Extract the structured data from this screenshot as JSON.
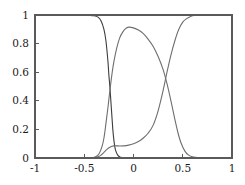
{
  "chart_data": {
    "type": "line",
    "title": "",
    "subtitle": "",
    "xlabel": "",
    "ylabel": "",
    "xlim": [
      -1,
      1
    ],
    "ylim": [
      0,
      1
    ],
    "grid": false,
    "legend": "none",
    "background_color": "#ffffff",
    "axis_color": "#5a5a5a",
    "xticks": [
      -1,
      -0.5,
      0,
      0.5,
      1
    ],
    "xtick_labels": [
      "-1",
      "-0.5",
      "0",
      "0.5",
      "1"
    ],
    "yticks": [
      0,
      0.2,
      0.4,
      0.6,
      0.8,
      1
    ],
    "ytick_labels": [
      "0",
      "0.2",
      "0.4",
      "0.6",
      "0.8",
      "1"
    ],
    "series": [
      {
        "name": "class-1-posterior",
        "color": "#3d3d3d",
        "linewidth": 1.1,
        "description": "High plateau at 1 on the left, sharp sigmoid drop to 0 near x = -0.23",
        "x": [
          -1.0,
          -0.9,
          -0.8,
          -0.7,
          -0.6,
          -0.55,
          -0.5,
          -0.45,
          -0.4,
          -0.36,
          -0.33,
          -0.3,
          -0.28,
          -0.26,
          -0.25,
          -0.24,
          -0.23,
          -0.22,
          -0.21,
          -0.2,
          -0.19,
          -0.18,
          -0.16,
          -0.14,
          -0.12,
          -0.1,
          -0.05,
          0.0,
          0.2,
          0.5,
          1.0
        ],
        "y": [
          1.0,
          1.0,
          1.0,
          1.0,
          1.0,
          1.0,
          0.999,
          0.998,
          0.995,
          0.985,
          0.96,
          0.9,
          0.82,
          0.68,
          0.58,
          0.5,
          0.4,
          0.3,
          0.2,
          0.13,
          0.08,
          0.05,
          0.02,
          0.008,
          0.004,
          0.002,
          0.0,
          0.0,
          0.0,
          0.0,
          0.0
        ]
      },
      {
        "name": "class-2-posterior",
        "color": "#6e6e6e",
        "linewidth": 1.1,
        "description": "Central bump rising from 0 near x = -0.35, peaking at about 0.915 near x = -0.05, falling to 0 near x = 0.55",
        "x": [
          -1.0,
          -0.7,
          -0.5,
          -0.42,
          -0.38,
          -0.35,
          -0.32,
          -0.3,
          -0.28,
          -0.26,
          -0.24,
          -0.22,
          -0.2,
          -0.17,
          -0.14,
          -0.11,
          -0.08,
          -0.05,
          0.0,
          0.05,
          0.1,
          0.15,
          0.2,
          0.25,
          0.3,
          0.34,
          0.38,
          0.42,
          0.45,
          0.48,
          0.52,
          0.56,
          0.6,
          0.7,
          1.0
        ],
        "y": [
          0.0,
          0.0,
          0.0,
          0.002,
          0.01,
          0.03,
          0.08,
          0.14,
          0.24,
          0.35,
          0.47,
          0.58,
          0.67,
          0.77,
          0.84,
          0.88,
          0.905,
          0.915,
          0.91,
          0.895,
          0.87,
          0.83,
          0.78,
          0.71,
          0.62,
          0.52,
          0.4,
          0.27,
          0.18,
          0.11,
          0.05,
          0.02,
          0.008,
          0.001,
          0.0
        ]
      },
      {
        "name": "class-3-posterior",
        "color": "#6e6e6e",
        "linewidth": 1.1,
        "description": "Low shoulder near x = -0.2 at about 0.08, slow rise crossing 0.5 near x = 0.3, saturating at 1 past x = 0.55",
        "x": [
          -1.0,
          -0.6,
          -0.45,
          -0.4,
          -0.36,
          -0.33,
          -0.3,
          -0.27,
          -0.24,
          -0.22,
          -0.2,
          -0.17,
          -0.14,
          -0.1,
          -0.05,
          0.0,
          0.05,
          0.1,
          0.15,
          0.2,
          0.25,
          0.3,
          0.34,
          0.38,
          0.42,
          0.46,
          0.5,
          0.54,
          0.58,
          0.62,
          0.7,
          0.8,
          0.9,
          1.0
        ],
        "y": [
          0.0,
          0.0,
          0.0,
          0.002,
          0.008,
          0.02,
          0.04,
          0.06,
          0.075,
          0.082,
          0.085,
          0.085,
          0.084,
          0.085,
          0.09,
          0.1,
          0.115,
          0.14,
          0.175,
          0.23,
          0.33,
          0.47,
          0.6,
          0.72,
          0.82,
          0.9,
          0.95,
          0.975,
          0.99,
          0.996,
          0.999,
          1.0,
          1.0,
          1.0
        ]
      }
    ]
  },
  "axes": {
    "plot_left_px": 35,
    "plot_right_px": 232,
    "plot_top_px": 15,
    "plot_bottom_px": 158
  }
}
